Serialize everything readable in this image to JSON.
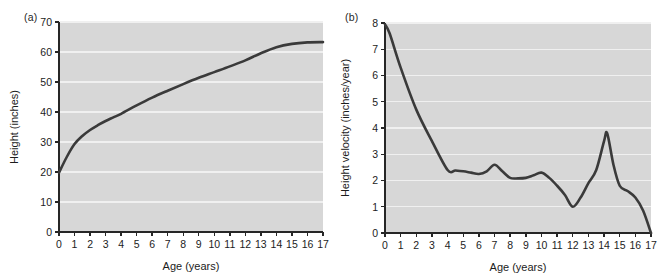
{
  "figure": {
    "background": "#ffffff",
    "plot_background": "#d7d7d7",
    "gridline_color": "#f0f0f0",
    "axis_color": "#262626",
    "curve_color": "#3a3a3a"
  },
  "panels": {
    "a": {
      "label": "(a)",
      "xlabel": "Age  (years)",
      "ylabel": "Height (inches)",
      "xticks": [
        "0",
        "1",
        "2",
        "3",
        "4",
        "5",
        "6",
        "7",
        "8",
        "9",
        "10",
        "11",
        "12",
        "13",
        "14",
        "15",
        "16",
        "17"
      ],
      "yticks": [
        "0",
        "10",
        "20",
        "30",
        "40",
        "50",
        "60",
        "70"
      ]
    },
    "b": {
      "label": "(b)",
      "xlabel": "Age  (years)",
      "ylabel": "Height velocity (inches/year)",
      "xticks": [
        "0",
        "1",
        "2",
        "3",
        "4",
        "5",
        "6",
        "7",
        "8",
        "9",
        "10",
        "11",
        "12",
        "13",
        "14",
        "15",
        "16",
        "17"
      ],
      "yticks": [
        "0",
        "1",
        "2",
        "3",
        "4",
        "5",
        "6",
        "7",
        "8"
      ]
    }
  },
  "chart_data": [
    {
      "type": "line",
      "panel": "a",
      "title": "(a)",
      "xlabel": "Age  (years)",
      "ylabel": "Height (inches)",
      "xlim": [
        0,
        17
      ],
      "ylim": [
        0,
        70
      ],
      "xticks": [
        0,
        1,
        2,
        3,
        4,
        5,
        6,
        7,
        8,
        9,
        10,
        11,
        12,
        13,
        14,
        15,
        16,
        17
      ],
      "yticks": [
        0,
        10,
        20,
        30,
        40,
        50,
        60,
        70
      ],
      "grid": true,
      "legend": "none",
      "series": [
        {
          "name": "Height",
          "x": [
            0,
            0.5,
            1,
            1.5,
            2,
            2.5,
            3,
            3.5,
            4,
            5,
            6,
            7,
            8,
            9,
            10,
            11,
            12,
            13,
            14,
            15,
            16,
            17
          ],
          "values": [
            19.8,
            25.0,
            29.3,
            32.0,
            34.0,
            35.6,
            37.0,
            38.2,
            39.4,
            42.2,
            44.8,
            47.1,
            49.3,
            51.4,
            53.3,
            55.2,
            57.2,
            59.6,
            61.6,
            62.7,
            63.2,
            63.3
          ]
        }
      ]
    },
    {
      "type": "line",
      "panel": "b",
      "title": "(b)",
      "xlabel": "Age  (years)",
      "ylabel": "Height velocity (inches/year)",
      "xlim": [
        0,
        17
      ],
      "ylim": [
        0,
        8
      ],
      "xticks": [
        0,
        1,
        2,
        3,
        4,
        5,
        6,
        7,
        8,
        9,
        10,
        11,
        12,
        13,
        14,
        15,
        16,
        17
      ],
      "yticks": [
        0,
        1,
        2,
        3,
        4,
        5,
        6,
        7,
        8
      ],
      "grid": true,
      "legend": "none",
      "series": [
        {
          "name": "Height velocity",
          "x": [
            0,
            0.3,
            1,
            2,
            3,
            4,
            4.5,
            5,
            5.5,
            6,
            6.5,
            7,
            7.5,
            8,
            8.5,
            9,
            9.5,
            10,
            10.5,
            11,
            11.5,
            12,
            12.5,
            13,
            13.5,
            14,
            14.2,
            14.6,
            15,
            15.5,
            16,
            16.5,
            17
          ],
          "values": [
            7.95,
            7.6,
            6.3,
            4.7,
            3.5,
            2.4,
            2.38,
            2.35,
            2.3,
            2.25,
            2.35,
            2.6,
            2.35,
            2.1,
            2.08,
            2.1,
            2.2,
            2.3,
            2.1,
            1.8,
            1.45,
            1.0,
            1.35,
            1.9,
            2.4,
            3.5,
            3.8,
            2.6,
            1.8,
            1.6,
            1.35,
            0.85,
            0.0
          ]
        }
      ]
    }
  ]
}
